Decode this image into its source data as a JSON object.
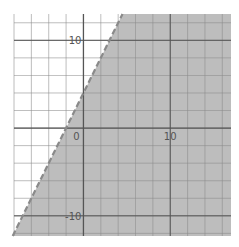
{
  "chart_data": {
    "type": "area",
    "title": "",
    "inequality": "y < 2x + 4",
    "boundary": {
      "slope": 2,
      "intercept": 4,
      "style": "dashed"
    },
    "shaded_side": "right/below",
    "xlim": [
      -8,
      17
    ],
    "ylim": [
      -12.3,
      13
    ],
    "grid": true,
    "grid_step": 2,
    "x_tick_labels": [
      {
        "value": 0,
        "label": "0"
      },
      {
        "value": 10,
        "label": "10"
      }
    ],
    "y_tick_labels": [
      {
        "value": 10,
        "label": "10"
      },
      {
        "value": -10,
        "label": "-10"
      }
    ],
    "xlabel": "",
    "ylabel": "",
    "colors": {
      "shade": "#bdbdbd",
      "grid": "#8c8c8c",
      "axis": "#555555",
      "boundary": "#8a8a8a",
      "label": "#555555"
    }
  }
}
